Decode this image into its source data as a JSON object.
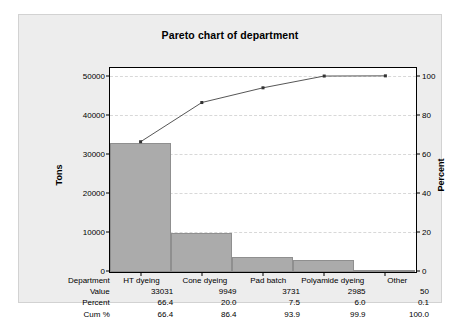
{
  "chart_data": {
    "type": "bar",
    "title": "Pareto chart of department",
    "categories": [
      "HT dyeing",
      "Cone dyeing",
      "Pad batch",
      "Polyamide dyeing",
      "Other"
    ],
    "values": [
      33031,
      9949,
      3731,
      2985,
      50
    ],
    "percent": [
      66.4,
      20.0,
      7.5,
      6.0,
      0.1
    ],
    "cum_percent": [
      66.4,
      86.4,
      93.9,
      99.9,
      100.0
    ],
    "xlabel": "",
    "ylabel": "Tons",
    "y2label": "Percent",
    "ylim": [
      0,
      52000
    ],
    "y2lim": [
      0,
      104
    ],
    "yticks": [
      0,
      10000,
      20000,
      30000,
      40000,
      50000
    ],
    "yticklabels": [
      "0",
      "10000",
      "20000",
      "30000",
      "40000",
      "50000"
    ],
    "y2ticks": [
      0,
      20,
      40,
      60,
      80,
      100
    ],
    "y2ticklabels": [
      "0",
      "20",
      "40",
      "60",
      "80",
      "100"
    ],
    "grid": true,
    "legend": "none",
    "bar_color": "#ababab",
    "bar_edge_color": "#8f8f8f",
    "line_color": "#444444",
    "marker_color": "#333333",
    "background_color": "#ededed",
    "plot_background_color": "#ffffff"
  },
  "table": {
    "row_labels": [
      "Department",
      "Value",
      "Percent",
      "Cum %"
    ],
    "departments": [
      "HT dyeing",
      "Cone dyeing",
      "Pad batch",
      "Polyamide dyeing",
      "Other"
    ],
    "value_row": [
      "33031",
      "9949",
      "3731",
      "2985",
      "50"
    ],
    "percent_row": [
      "66.4",
      "20.0",
      "7.5",
      "6.0",
      "0.1"
    ],
    "cum_row": [
      "66.4",
      "86.4",
      "93.9",
      "99.9",
      "100.0"
    ]
  }
}
